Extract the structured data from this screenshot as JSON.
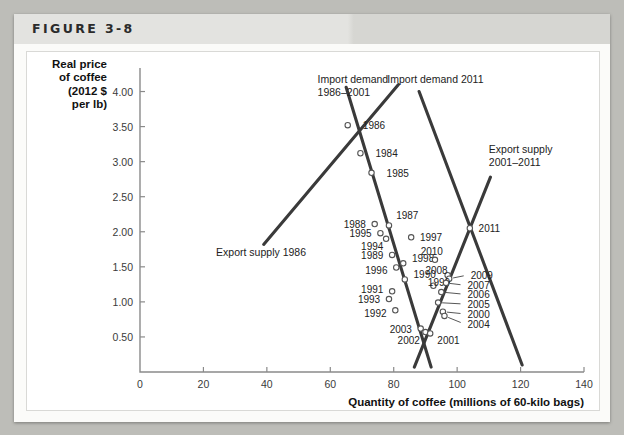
{
  "figure": {
    "label": "FIGURE 3-8"
  },
  "chart_data": {
    "type": "scatter",
    "title": "",
    "xlabel": "Quantity of coffee (millions of 60-kilo bags)",
    "ylabel": "Real price of coffee (2012 $ per lb)",
    "ylabel_lines": [
      "Real price",
      "of coffee",
      "(2012 $",
      "per lb)"
    ],
    "xlim": [
      0,
      140
    ],
    "ylim": [
      0,
      4.25
    ],
    "xticks": [
      0,
      20,
      40,
      60,
      80,
      100,
      120,
      140
    ],
    "xticklabels": [
      "0",
      "20",
      "40",
      "60",
      "80",
      "100",
      "120",
      "140"
    ],
    "yticks": [
      0.5,
      1.0,
      1.5,
      2.0,
      2.5,
      3.0,
      3.5,
      4.0
    ],
    "yticklabels": [
      "0.50",
      "1.00",
      "1.50",
      "2.00",
      "2.50",
      "3.00",
      "3.50",
      "4.00"
    ],
    "grid": false,
    "legend_position": "inline-annotations",
    "marker_color": "#ffffff",
    "marker_edge_color": "#555555",
    "curve_color": "#3a3a3a",
    "points": [
      {
        "label": "1986",
        "x": 65.5,
        "y": 3.52,
        "lx": 69.0,
        "ly": 3.52,
        "anchor": "start"
      },
      {
        "label": "1984",
        "x": 69.5,
        "y": 3.12,
        "lx": 73.0,
        "ly": 3.12,
        "anchor": "start"
      },
      {
        "label": "1985",
        "x": 73.0,
        "y": 2.84,
        "lx": 76.5,
        "ly": 2.84,
        "anchor": "start"
      },
      {
        "label": "1987",
        "x": 78.5,
        "y": 2.09,
        "lx": 79.5,
        "ly": 2.24,
        "anchor": "start"
      },
      {
        "label": "1988",
        "x": 74.0,
        "y": 2.11,
        "lx": 72.5,
        "ly": 2.11,
        "anchor": "end"
      },
      {
        "label": "1995",
        "x": 75.8,
        "y": 1.98,
        "lx": 74.3,
        "ly": 1.98,
        "anchor": "end"
      },
      {
        "label": "1994",
        "x": 77.6,
        "y": 1.9,
        "lx": 78.0,
        "ly": 1.8,
        "anchor": "end"
      },
      {
        "label": "1997",
        "x": 85.5,
        "y": 1.92,
        "lx": 87.0,
        "ly": 1.92,
        "anchor": "start"
      },
      {
        "label": "1989",
        "x": 79.5,
        "y": 1.67,
        "lx": 78.0,
        "ly": 1.67,
        "anchor": "end"
      },
      {
        "label": "1998",
        "x": 83.0,
        "y": 1.55,
        "lx": 84.5,
        "ly": 1.62,
        "anchor": "start"
      },
      {
        "label": "1996",
        "x": 80.8,
        "y": 1.49,
        "lx": 79.3,
        "ly": 1.45,
        "anchor": "end"
      },
      {
        "label": "1990",
        "x": 83.5,
        "y": 1.32,
        "lx": 85.0,
        "ly": 1.4,
        "anchor": "start"
      },
      {
        "label": "2010",
        "x": 93.0,
        "y": 1.6,
        "lx": 92.0,
        "ly": 1.73,
        "anchor": "middle"
      },
      {
        "label": "2008",
        "x": 97.0,
        "y": 1.38,
        "lx": 93.5,
        "ly": 1.45,
        "anchor": "middle"
      },
      {
        "label": "2009",
        "x": 97.5,
        "y": 1.33,
        "lx": 103.0,
        "ly": 1.38,
        "anchor": "start"
      },
      {
        "label": "1999",
        "x": 92.5,
        "y": 1.23,
        "lx": 89.5,
        "ly": 1.29,
        "anchor": "start"
      },
      {
        "label": "2007",
        "x": 96.5,
        "y": 1.27,
        "lx": 102.0,
        "ly": 1.24,
        "anchor": "start"
      },
      {
        "label": "1991",
        "x": 79.5,
        "y": 1.15,
        "lx": 78.0,
        "ly": 1.18,
        "anchor": "end"
      },
      {
        "label": "2006",
        "x": 95.0,
        "y": 1.14,
        "lx": 102.0,
        "ly": 1.11,
        "anchor": "start"
      },
      {
        "label": "1993",
        "x": 78.5,
        "y": 1.04,
        "lx": 77.0,
        "ly": 1.04,
        "anchor": "end"
      },
      {
        "label": "2005",
        "x": 94.0,
        "y": 0.99,
        "lx": 102.0,
        "ly": 0.97,
        "anchor": "start"
      },
      {
        "label": "1992",
        "x": 80.5,
        "y": 0.88,
        "lx": 79.0,
        "ly": 0.84,
        "anchor": "end"
      },
      {
        "label": "2000",
        "x": 95.5,
        "y": 0.86,
        "lx": 102.0,
        "ly": 0.83,
        "anchor": "start"
      },
      {
        "label": "2004",
        "x": 96.0,
        "y": 0.8,
        "lx": 102.0,
        "ly": 0.69,
        "anchor": "start"
      },
      {
        "label": "2003",
        "x": 88.5,
        "y": 0.62,
        "lx": 87.0,
        "ly": 0.62,
        "anchor": "end"
      },
      {
        "label": "2002",
        "x": 90.0,
        "y": 0.57,
        "lx": 89.5,
        "ly": 0.46,
        "anchor": "end"
      },
      {
        "label": "2001",
        "x": 91.5,
        "y": 0.55,
        "lx": 92.5,
        "ly": 0.46,
        "anchor": "start"
      },
      {
        "label": "2011",
        "x": 104.0,
        "y": 2.05,
        "lx": 105.5,
        "ly": 2.05,
        "anchor": "start"
      }
    ],
    "curves": [
      {
        "name": "Import demand 1986-2001",
        "label_lines": [
          "Import demand",
          "1986–2001"
        ],
        "label_x": 56.0,
        "label_y": 4.12,
        "label_anchor": "start",
        "x1": 65.0,
        "y1": 4.06,
        "x2": 91.8,
        "y2": 0.07
      },
      {
        "name": "Export supply 1986",
        "label_lines": [
          "Export supply 1986"
        ],
        "label_x": 24.0,
        "label_y": 1.66,
        "label_anchor": "start",
        "x1": 39.0,
        "y1": 1.82,
        "x2": 81.5,
        "y2": 4.1
      },
      {
        "name": "Import demand 2011",
        "label_lines": [
          "Import demand 2011"
        ],
        "label_x": 78.0,
        "label_y": 4.12,
        "label_anchor": "start",
        "x1": 88.0,
        "y1": 4.0,
        "x2": 120.5,
        "y2": 0.1
      },
      {
        "name": "Export supply 2001-2011",
        "label_lines": [
          "Export supply",
          "2001–2011"
        ],
        "label_x": 110.0,
        "label_y": 3.12,
        "label_anchor": "start",
        "x1": 86.5,
        "y1": 0.07,
        "x2": 110.5,
        "y2": 2.78
      }
    ]
  }
}
